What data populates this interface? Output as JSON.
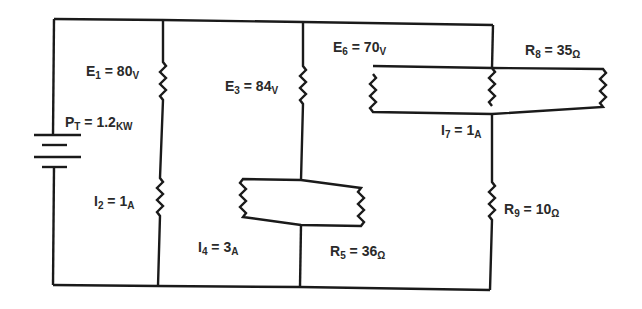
{
  "diagram": {
    "type": "electrical-circuit",
    "wire_color": "#1a1a1a",
    "text_color": "#2a2a2a",
    "source": {
      "name": "battery",
      "label": {
        "sym": "P",
        "sub": "T",
        "eq": " = 1.2",
        "unit": "KW"
      }
    },
    "labels": [
      {
        "id": "E1",
        "sym": "E",
        "sub": "1",
        "eq": " = 80",
        "unit": "V"
      },
      {
        "id": "E3",
        "sym": "E",
        "sub": "3",
        "eq": " = 84",
        "unit": "V"
      },
      {
        "id": "E6",
        "sym": "E",
        "sub": "6",
        "eq": " = 70",
        "unit": "V"
      },
      {
        "id": "R8",
        "sym": "R",
        "sub": "8",
        "eq": " = 35",
        "unit": "Ω"
      },
      {
        "id": "I7",
        "sym": "I",
        "sub": "7",
        "eq": " = 1",
        "unit": "A"
      },
      {
        "id": "I2",
        "sym": "I",
        "sub": "2",
        "eq": " = 1",
        "unit": "A"
      },
      {
        "id": "I4",
        "sym": "I",
        "sub": "4",
        "eq": " = 3",
        "unit": "A"
      },
      {
        "id": "R5",
        "sym": "R",
        "sub": "5",
        "eq": " = 36",
        "unit": "Ω"
      },
      {
        "id": "R9",
        "sym": "R",
        "sub": "9",
        "eq": " = 10",
        "unit": "Ω"
      }
    ]
  }
}
